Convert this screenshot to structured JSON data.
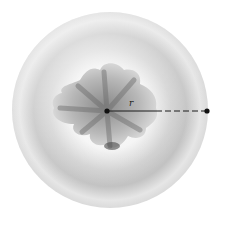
{
  "figure": {
    "sphere": {
      "cx": 110,
      "cy": 110,
      "r": 98,
      "fill_light": "#f4f4f4",
      "fill_mid": "#d9d9d9",
      "fill_dark": "#a8a8a8"
    },
    "cavity": {
      "fill_light": "#d6d6d6",
      "fill_dark": "#5a5a5a"
    },
    "center_point": {
      "x": 107,
      "y": 111
    },
    "surface_point": {
      "x": 207,
      "y": 111
    },
    "radius_label": "r",
    "line_color": "#1a1a1a"
  }
}
